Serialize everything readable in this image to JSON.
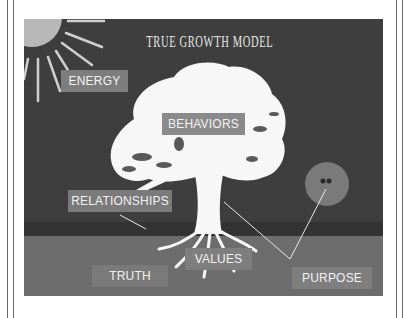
{
  "slide": {
    "title": "TRUE GROWTH MODEL",
    "labels": {
      "energy": "ENERGY",
      "behaviors": "BEHAVIORS",
      "relationships": "RELATIONSHIPS",
      "values": "VALUES",
      "truth": "TRUTH",
      "purpose": "PURPOSE"
    },
    "colors": {
      "sky": "#3e3e3e",
      "horizon_band": "#333333",
      "ground": "#6d6d6d",
      "label_box": "#8a8a8a",
      "tree": "#ffffff"
    }
  }
}
